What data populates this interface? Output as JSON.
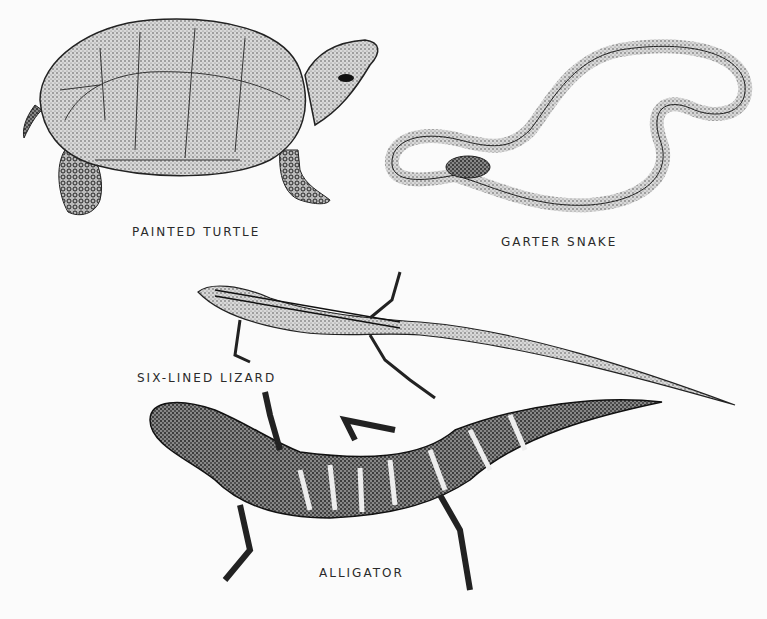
{
  "plate": {
    "background": "#fbfbfb",
    "ink": "#1e1e1e",
    "animals": [
      {
        "id": "painted-turtle",
        "label": "PAINTED TURTLE"
      },
      {
        "id": "garter-snake",
        "label": "GARTER SNAKE"
      },
      {
        "id": "six-lined-lizard",
        "label": "SIX-LINED LIZARD"
      },
      {
        "id": "alligator",
        "label": "ALLIGATOR"
      }
    ]
  }
}
